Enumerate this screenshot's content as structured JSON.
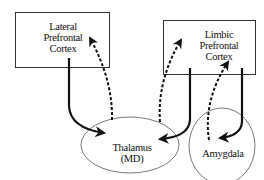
{
  "diagram": {
    "nodes": [
      {
        "id": "lateral_pfc",
        "shape": "rectangle",
        "lines": [
          "Lateral",
          "Prefrontal",
          "Cortex"
        ]
      },
      {
        "id": "limbic_pfc",
        "shape": "rectangle",
        "lines": [
          "Limbic",
          "Prefrontal",
          "Cortex"
        ]
      },
      {
        "id": "thalamus",
        "shape": "ellipse",
        "lines": [
          "Thalamus",
          "(MD)"
        ]
      },
      {
        "id": "amygdala",
        "shape": "ellipse",
        "lines": [
          "Amygdala"
        ]
      }
    ],
    "edges": [
      {
        "from": "lateral_pfc",
        "to": "thalamus",
        "style": "solid"
      },
      {
        "from": "thalamus",
        "to": "lateral_pfc",
        "style": "dashed"
      },
      {
        "from": "limbic_pfc",
        "to": "thalamus",
        "style": "solid"
      },
      {
        "from": "thalamus",
        "to": "limbic_pfc",
        "style": "dashed"
      },
      {
        "from": "limbic_pfc",
        "to": "amygdala",
        "style": "solid"
      },
      {
        "from": "amygdala",
        "to": "limbic_pfc",
        "style": "dashed"
      }
    ],
    "colors": {
      "stroke": "#111111",
      "box_border": "#333333",
      "ellipse_border": "#555555",
      "background": "#ffffff"
    }
  },
  "labels": {
    "lateral_1": "Lateral",
    "lateral_2": "Prefrontal",
    "lateral_3": "Cortex",
    "limbic_1": "Limbic",
    "limbic_2": "Prefrontal",
    "limbic_3": "Cortex",
    "thalamus_1": "Thalamus",
    "thalamus_2": "(MD)",
    "amygdala": "Amygdala"
  }
}
